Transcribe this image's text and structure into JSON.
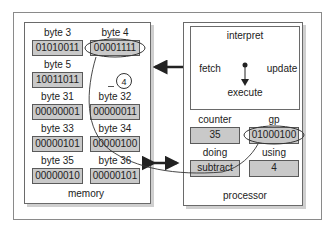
{
  "memory": {
    "title": "memory",
    "bytes": [
      {
        "label": "byte 3",
        "value": "01010011"
      },
      {
        "label": "byte 4",
        "value": "00001111"
      },
      {
        "label": "byte 5",
        "value": "10011011"
      },
      {
        "label": "byte 31",
        "value": "00000001"
      },
      {
        "label": "byte 32",
        "value": "00000011"
      },
      {
        "label": "byte 33",
        "value": "00000101"
      },
      {
        "label": "byte 34",
        "value": "00000100"
      },
      {
        "label": "byte 35",
        "value": "00000010"
      },
      {
        "label": "byte 36",
        "value": "00000101"
      }
    ],
    "ellipsis": "...",
    "callout_number": "4"
  },
  "processor": {
    "title": "processor",
    "interpret": {
      "title": "interpret",
      "fetch": "fetch",
      "execute": "execute",
      "update": "update"
    },
    "registers": [
      {
        "label": "counter",
        "value": "35"
      },
      {
        "label": "gp",
        "value": "01000100"
      },
      {
        "label": "doing",
        "value": "subtract"
      },
      {
        "label": "using",
        "value": "4"
      }
    ]
  },
  "colors": {
    "cell_fill": "#c9c9c9",
    "border": "#5a5a5a",
    "shadow": "#cfcfcf",
    "arrow": "#222222"
  }
}
